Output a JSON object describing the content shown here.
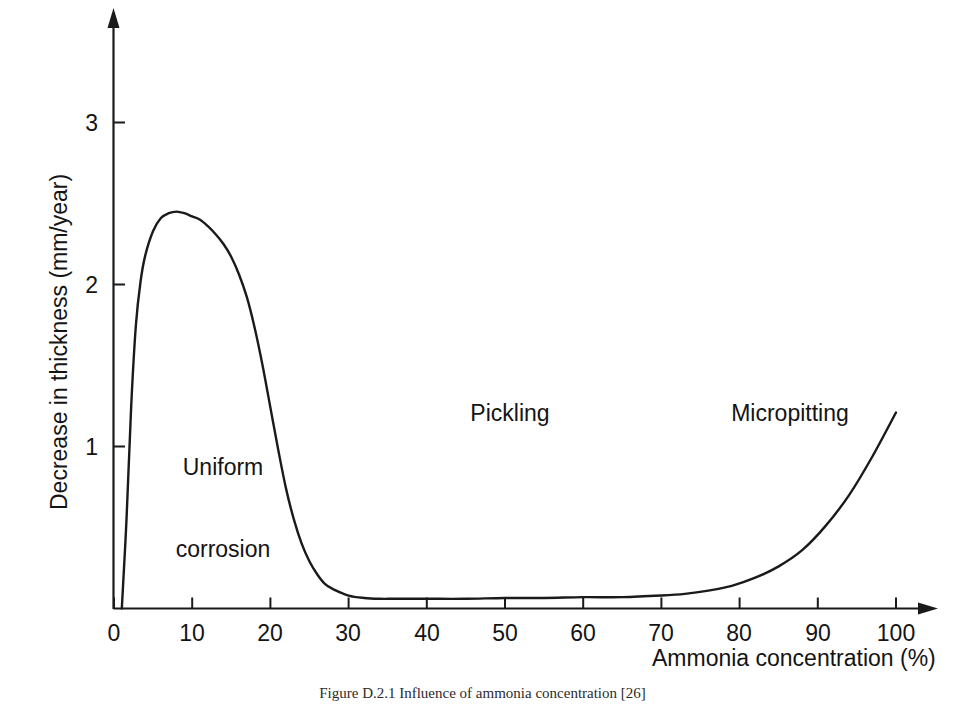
{
  "chart_data": {
    "type": "line",
    "title": "",
    "xlabel": "Ammonia concentration (%)",
    "ylabel": "Decrease in thickness (mm/year)",
    "xlim": [
      0,
      104
    ],
    "ylim": [
      0,
      3.65
    ],
    "grid": false,
    "legend": "none",
    "xticks": [
      "0",
      "10",
      "20",
      "30",
      "40",
      "50",
      "60",
      "70",
      "80",
      "90",
      "100"
    ],
    "xtick_values": [
      0,
      10,
      20,
      30,
      40,
      50,
      60,
      70,
      80,
      90,
      100
    ],
    "yticks": [
      "1",
      "2",
      "3"
    ],
    "ytick_values": [
      1,
      2,
      3
    ],
    "series": [
      {
        "name": "Decrease in thickness",
        "x": [
          1.0,
          1.6,
          2.2,
          2.8,
          3.4,
          4.0,
          5.0,
          6.0,
          7.0,
          8.0,
          9.0,
          10.0,
          11.0,
          12.0,
          13.0,
          14.0,
          15.0,
          16.0,
          17.0,
          18.0,
          19.0,
          20.0,
          21.0,
          22.0,
          23.0,
          24.0,
          25.0,
          26.0,
          27.0,
          28.0,
          30.0,
          32.0,
          34.0,
          36.0,
          40.0,
          45.0,
          50.0,
          55.0,
          60.0,
          65.0,
          70.0,
          73.0,
          76.0,
          79.0,
          82.0,
          85.0,
          88.0,
          91.0,
          94.0,
          97.0,
          100.0
        ],
        "y": [
          0.0,
          0.55,
          1.25,
          1.75,
          2.02,
          2.18,
          2.33,
          2.41,
          2.44,
          2.45,
          2.44,
          2.42,
          2.4,
          2.36,
          2.31,
          2.25,
          2.17,
          2.06,
          1.92,
          1.73,
          1.5,
          1.24,
          0.98,
          0.74,
          0.55,
          0.4,
          0.29,
          0.21,
          0.15,
          0.12,
          0.08,
          0.065,
          0.06,
          0.06,
          0.06,
          0.06,
          0.065,
          0.065,
          0.07,
          0.07,
          0.08,
          0.09,
          0.11,
          0.14,
          0.19,
          0.26,
          0.36,
          0.51,
          0.7,
          0.94,
          1.21
        ]
      }
    ],
    "annotations": [
      {
        "text_line1": "Uniform",
        "text_line2": "corrosion",
        "x": 9,
        "y": 1.3
      },
      {
        "text_line1": "Pickling",
        "text_line2": "",
        "x": 47,
        "y": 1.3
      },
      {
        "text_line1": "Micropitting",
        "text_line2": "",
        "x": 81,
        "y": 1.3
      }
    ],
    "colors": {
      "curve": "#1a1a1a",
      "axis": "#1a1a1a",
      "background": "#ffffff",
      "text": "#141414"
    }
  },
  "axes": {
    "y_title": "Decrease in thickness (mm/year)",
    "x_title": "Ammonia concentration (%)",
    "y_tick_labels": [
      "3",
      "2",
      "1"
    ],
    "x_tick_labels": [
      "0",
      "10",
      "20",
      "30",
      "40",
      "50",
      "60",
      "70",
      "80",
      "90",
      "100"
    ]
  },
  "regions": {
    "uniform_corrosion_line1": "Uniform",
    "uniform_corrosion_line2": "corrosion",
    "pickling": "Pickling",
    "micropitting": "Micropitting"
  },
  "caption": {
    "text": "Figure D.2.1  Influence of ammonia concentration [26]"
  }
}
